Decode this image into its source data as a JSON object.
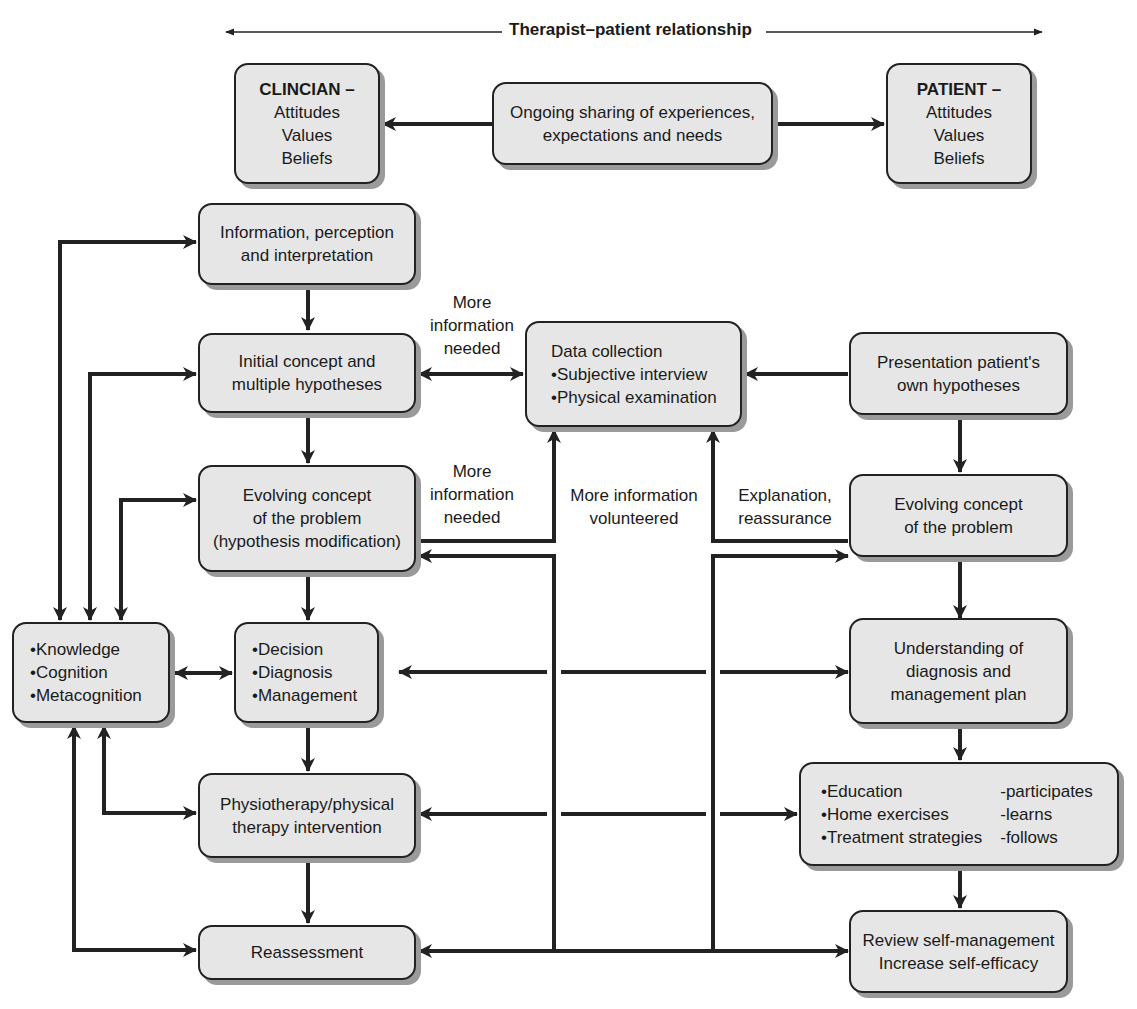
{
  "header": {
    "title": "Therapist–patient relationship"
  },
  "top_row": {
    "clinician": {
      "title": "CLINCIAN –",
      "lines": [
        "Attitudes",
        "Values",
        "Beliefs"
      ]
    },
    "sharing": {
      "lines": [
        "Ongoing sharing of experiences,",
        "expectations and needs"
      ]
    },
    "patient": {
      "title": "PATIENT –",
      "lines": [
        "Attitudes",
        "Values",
        "Beliefs"
      ]
    }
  },
  "clinician_column": {
    "information": {
      "lines": [
        "Information, perception",
        "and interpretation"
      ]
    },
    "initial_concept": {
      "lines": [
        "Initial concept and",
        "multiple hypotheses"
      ]
    },
    "evolving_concept": {
      "lines": [
        "Evolving concept",
        "of the problem",
        "(hypothesis modification)"
      ]
    },
    "decision": {
      "lines": [
        "•Decision",
        "•Diagnosis",
        "•Management"
      ]
    },
    "intervention": {
      "lines": [
        "Physiotherapy/physical",
        "therapy intervention"
      ]
    },
    "reassessment": {
      "lines": [
        "Reassessment"
      ]
    }
  },
  "knowledge_box": {
    "lines": [
      "•Knowledge",
      "•Cognition",
      "•Metacognition"
    ]
  },
  "data_collection": {
    "lines": [
      "Data collection",
      "•Subjective interview",
      "•Physical examination"
    ]
  },
  "patient_column": {
    "presentation": {
      "lines": [
        "Presentation patient's",
        "own hypotheses"
      ]
    },
    "evolving_concept": {
      "lines": [
        "Evolving concept",
        "of the problem"
      ]
    },
    "understanding": {
      "lines": [
        "Understanding of",
        "diagnosis and",
        "management plan"
      ]
    },
    "activities": {
      "items": [
        "•Education",
        "•Home exercises",
        "•Treatment strategies"
      ],
      "actions": [
        "-participates",
        "-learns",
        "-follows"
      ]
    },
    "review": {
      "lines": [
        "Review self-management",
        "Increase self-efficacy"
      ]
    }
  },
  "edge_labels": {
    "more_info_needed_1": [
      "More",
      "information",
      "needed"
    ],
    "more_info_needed_2": [
      "More",
      "information",
      "needed"
    ],
    "more_info_volunteered": [
      "More information",
      "volunteered"
    ],
    "explanation": [
      "Explanation,",
      "reassurance"
    ]
  },
  "colors": {
    "box_fill": "#e6e6e6",
    "stroke": "#222222",
    "shadow": "#9a9a9a"
  }
}
